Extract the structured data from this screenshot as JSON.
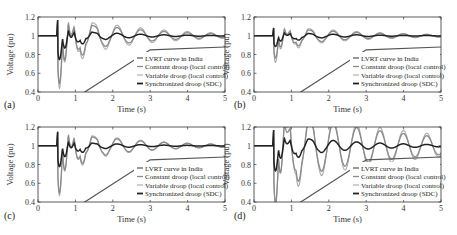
{
  "figure": {
    "panels": [
      "a",
      "b",
      "c",
      "d"
    ]
  },
  "chart_data": [
    {
      "panel": "(a)",
      "type": "line",
      "title": "",
      "xlabel": "Time (s)",
      "ylabel": "Voltage (pu)",
      "xlim": [
        0,
        5
      ],
      "ylim": [
        0.4,
        1.2
      ],
      "xticks": [
        "0",
        "1",
        "2",
        "3",
        "4",
        "5"
      ],
      "yticks": [
        "0.4",
        "0.6",
        "0.8",
        "1",
        "1.2"
      ],
      "grid": false,
      "legend_position": "lower right",
      "series": [
        {
          "name": "LVRT curve in India",
          "x": [
            0,
            1.25,
            3,
            5
          ],
          "y": [
            0.0,
            0.4,
            0.85,
            0.88
          ]
        },
        {
          "name": "Constant droop (local control)",
          "params": {
            "t0": 0.5,
            "dip": 0.55,
            "amp": 0.22,
            "freq": 1.6,
            "decay": 0.55,
            "spike": 1.2
          }
        },
        {
          "name": "Variable droop (local control)",
          "params": {
            "t0": 0.5,
            "dip": 0.6,
            "amp": 0.26,
            "freq": 1.6,
            "decay": 0.5,
            "spike": 1.2
          }
        },
        {
          "name": "Synchronized droop (SDC)",
          "params": {
            "t0": 0.5,
            "dip": 0.28,
            "amp": 0.1,
            "freq": 1.6,
            "decay": 0.8,
            "spike": 1.2
          }
        }
      ]
    },
    {
      "panel": "(b)",
      "type": "line",
      "title": "",
      "xlabel": "Time (s)",
      "ylabel": "Voltage (pu)",
      "xlim": [
        0,
        5
      ],
      "ylim": [
        0.4,
        1.2
      ],
      "xticks": [
        "0",
        "1",
        "2",
        "3",
        "4",
        "5"
      ],
      "yticks": [
        "0.4",
        "0.6",
        "0.8",
        "1",
        "1.2"
      ],
      "grid": false,
      "legend_position": "lower right",
      "series": [
        {
          "name": "LVRT curve in India",
          "x": [
            0,
            1.25,
            3,
            5
          ],
          "y": [
            0.0,
            0.4,
            0.85,
            0.88
          ]
        },
        {
          "name": "Constant droop (local control)",
          "params": {
            "t0": 0.5,
            "dip": 0.25,
            "amp": 0.12,
            "freq": 1.6,
            "decay": 0.55,
            "spike": 1.1
          }
        },
        {
          "name": "Variable droop (local control)",
          "params": {
            "t0": 0.5,
            "dip": 0.3,
            "amp": 0.14,
            "freq": 1.6,
            "decay": 0.5,
            "spike": 1.1
          }
        },
        {
          "name": "Synchronized droop (SDC)",
          "params": {
            "t0": 0.5,
            "dip": 0.12,
            "amp": 0.06,
            "freq": 1.6,
            "decay": 0.8,
            "spike": 1.1
          }
        }
      ]
    },
    {
      "panel": "(c)",
      "type": "line",
      "title": "",
      "xlabel": "Time (s)",
      "ylabel": "Voltage (pu)",
      "xlim": [
        0,
        5
      ],
      "ylim": [
        0.4,
        1.2
      ],
      "xticks": [
        "0",
        "1",
        "2",
        "3",
        "4",
        "5"
      ],
      "yticks": [
        "0.4",
        "0.6",
        "0.8",
        "1",
        "1.2"
      ],
      "grid": false,
      "legend_position": "lower right",
      "series": [
        {
          "name": "LVRT curve in India",
          "x": [
            0,
            1.25,
            3,
            5
          ],
          "y": [
            0.0,
            0.4,
            0.85,
            0.88
          ]
        },
        {
          "name": "Constant droop (local control)",
          "params": {
            "t0": 0.5,
            "dip": 0.55,
            "amp": 0.2,
            "freq": 1.6,
            "decay": 0.6,
            "spike": 1.18
          }
        },
        {
          "name": "Variable droop (local control)",
          "params": {
            "t0": 0.5,
            "dip": 0.58,
            "amp": 0.22,
            "freq": 1.6,
            "decay": 0.58,
            "spike": 1.18
          }
        },
        {
          "name": "Synchronized droop (SDC)",
          "params": {
            "t0": 0.5,
            "dip": 0.25,
            "amp": 0.08,
            "freq": 1.6,
            "decay": 0.85,
            "spike": 1.18
          }
        }
      ]
    },
    {
      "panel": "(d)",
      "type": "line",
      "title": "",
      "xlabel": "Time (s)",
      "ylabel": "Voltage (pu)",
      "xlim": [
        0,
        5
      ],
      "ylim": [
        0.4,
        1.2
      ],
      "xticks": [
        "0",
        "1",
        "2",
        "3",
        "4",
        "5"
      ],
      "yticks": [
        "0.4",
        "0.6",
        "0.8",
        "1",
        "1.2"
      ],
      "grid": false,
      "legend_position": "lower right",
      "series": [
        {
          "name": "LVRT curve in India",
          "x": [
            0,
            1.25,
            3,
            5
          ],
          "y": [
            0.0,
            0.4,
            0.85,
            0.88
          ]
        },
        {
          "name": "Constant droop (local control)",
          "params": {
            "t0": 0.5,
            "dip": 0.6,
            "amp": 0.4,
            "freq": 1.6,
            "decay": 0.32,
            "spike": 1.2
          }
        },
        {
          "name": "Variable droop (local control)",
          "params": {
            "t0": 0.5,
            "dip": 0.6,
            "amp": 0.46,
            "freq": 1.6,
            "decay": 0.3,
            "spike": 1.2
          }
        },
        {
          "name": "Synchronized droop (SDC)",
          "params": {
            "t0": 0.5,
            "dip": 0.28,
            "amp": 0.14,
            "freq": 1.6,
            "decay": 0.55,
            "spike": 1.2
          }
        }
      ]
    }
  ],
  "legend": {
    "items": [
      "LVRT curve in India",
      "Constant droop (local control)",
      "Variable droop (local control)",
      "Synchronized droop (SDC)"
    ]
  },
  "colors": {
    "lvrt": "#555555",
    "constant": "#8a8a8a",
    "variable": "#aaaaaa",
    "sdc": "#222222",
    "axis": "#333333"
  }
}
